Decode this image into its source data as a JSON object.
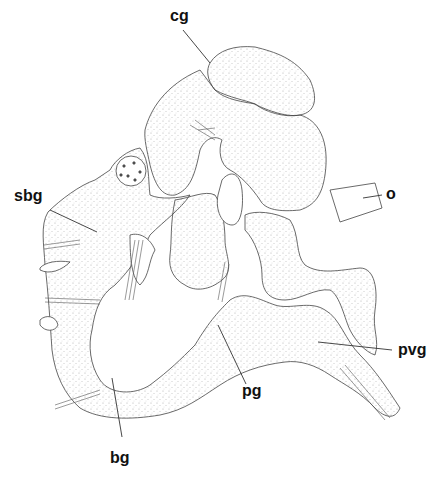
{
  "figure": {
    "type": "anatomical line drawing (stippled nervous system)",
    "labels": [
      {
        "id": "cg",
        "text": "cg",
        "x": 172,
        "y": 8,
        "leader": [
          [
            183,
            30
          ],
          [
            210,
            63
          ]
        ]
      },
      {
        "id": "o",
        "text": "o",
        "x": 385,
        "y": 186,
        "leader": [
          [
            382,
            195
          ],
          [
            363,
            198
          ]
        ]
      },
      {
        "id": "sbg",
        "text": "sbg",
        "x": 15,
        "y": 188,
        "leader": [
          [
            50,
            210
          ],
          [
            97,
            232
          ]
        ]
      },
      {
        "id": "pvg",
        "text": "pvg",
        "x": 398,
        "y": 342,
        "leader": [
          [
            392,
            350
          ],
          [
            318,
            342
          ]
        ]
      },
      {
        "id": "pg",
        "text": "pg",
        "x": 242,
        "y": 383,
        "leader": [
          [
            246,
            384
          ],
          [
            218,
            325
          ]
        ]
      },
      {
        "id": "bg",
        "text": "bg",
        "x": 110,
        "y": 450,
        "leader": [
          [
            122,
            437
          ],
          [
            112,
            378
          ]
        ]
      }
    ]
  },
  "colors": {
    "line": "#444444",
    "stipple": "#bbbbbb",
    "background": "#ffffff",
    "label": "#111111"
  }
}
